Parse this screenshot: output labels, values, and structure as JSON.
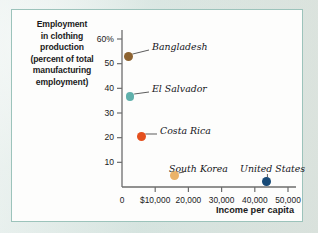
{
  "chart_data": {
    "type": "scatter",
    "title": "",
    "xlabel": "Income per capita",
    "ylabel": "Employment in clothing production (percent of total manufacturing employment)",
    "xlim": [
      0,
      55000
    ],
    "ylim": [
      0,
      62
    ],
    "grid": false,
    "legend": "none",
    "x_ticks": [
      "0",
      "$10,000",
      "20,000",
      "30,000",
      "40,000",
      "50,000"
    ],
    "x_tick_values": [
      0,
      10000,
      20000,
      30000,
      40000,
      50000
    ],
    "y_ticks": [
      "60%",
      "50",
      "40",
      "30",
      "20",
      "10"
    ],
    "y_tick_values": [
      60,
      50,
      40,
      30,
      20,
      10
    ],
    "points": [
      {
        "name": "Bangladesh",
        "x": 1900,
        "y": 53.0,
        "color": "#8d6331"
      },
      {
        "name": "El Salvador",
        "x": 2400,
        "y": 36.8,
        "color": "#5fb0ab"
      },
      {
        "name": "Costa Rica",
        "x": 5800,
        "y": 20.6,
        "color": "#e4501e"
      },
      {
        "name": "South Korea",
        "x": 15800,
        "y": 4.8,
        "color": "#eab36a"
      },
      {
        "name": "United States",
        "x": 43500,
        "y": 2.2,
        "color": "#184a77"
      }
    ]
  },
  "axes": {
    "y_label_lines": [
      "Employment",
      "in clothing",
      "production",
      "(percent of total",
      "manufacturing",
      "employment)"
    ],
    "y_label_full": "Employment in clothing production (percent of total manufacturing employment)",
    "x_title": "Income per capita",
    "origin_label": "0"
  },
  "colors": {
    "panel_background": "#fdfdfc",
    "panel_border": "#9cc3bb",
    "page_background": "#dbe7e3",
    "axis": "#6d6d6d",
    "text": "#1b1b1b",
    "leader_line": "#4a4a4a"
  }
}
